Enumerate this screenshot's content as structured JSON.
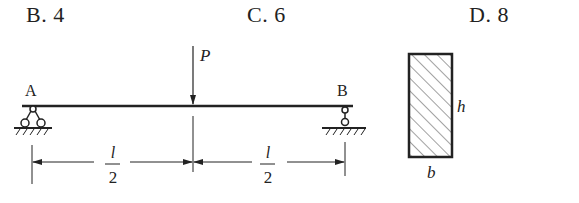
{
  "options": [
    {
      "letter": "B.",
      "value": "4"
    },
    {
      "letter": "C.",
      "value": "6"
    },
    {
      "letter": "D.",
      "value": "8"
    }
  ],
  "beam": {
    "load_label": "P",
    "support_left_label": "A",
    "support_right_label": "B",
    "dimensions": [
      {
        "numerator": "l",
        "denominator": "2"
      },
      {
        "numerator": "l",
        "denominator": "2"
      }
    ]
  },
  "cross_section": {
    "height_label": "h",
    "width_label": "b"
  }
}
